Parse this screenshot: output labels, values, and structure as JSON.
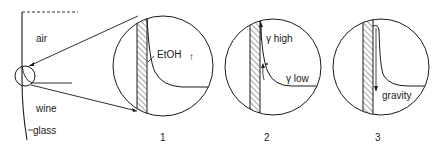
{
  "diagram": {
    "overview": {
      "labels": {
        "air": "air",
        "wine": "wine",
        "glass": "glass"
      }
    },
    "panels": [
      {
        "number": "1",
        "labels": {
          "species": "EtOH",
          "arrow": "↑"
        }
      },
      {
        "number": "2",
        "labels": {
          "high": "γ high",
          "low": "γ low"
        }
      },
      {
        "number": "3",
        "labels": {
          "force": "gravity"
        }
      }
    ],
    "colors": {
      "line": "#1a1a1a",
      "background": "#ffffff"
    }
  }
}
